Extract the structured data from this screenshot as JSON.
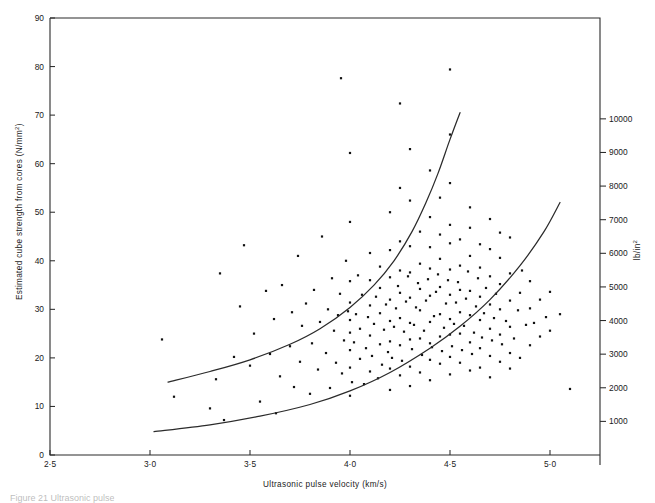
{
  "figure": {
    "caption": "Figure 21   Ultrasonic pulse",
    "background": "#ffffff",
    "ink_color": "#1a1a1a"
  },
  "chart_data": {
    "type": "scatter",
    "title": "",
    "xlabel": "Ultrasonic pulse velocity (km/s)",
    "ylabel": "Estimated cube strength from cores (N/mm²)",
    "y2label": "lb/in²",
    "xlim": [
      2.5,
      5.25
    ],
    "ylim": [
      0,
      90
    ],
    "y2lim": [
      0,
      13000
    ],
    "grid": false,
    "legend": null,
    "xticks": [
      "2·5",
      "3·0",
      "3·5",
      "4·0",
      "4·5",
      "5·0"
    ],
    "xtickvalues": [
      2.5,
      3.0,
      3.5,
      4.0,
      4.5,
      5.0
    ],
    "yticks": [
      "0",
      "10",
      "20",
      "30",
      "40",
      "50",
      "60",
      "70",
      "80",
      "90"
    ],
    "ytickvalues": [
      0,
      10,
      20,
      30,
      40,
      50,
      60,
      70,
      80,
      90
    ],
    "y2ticks": [
      "1000",
      "2000",
      "3000",
      "4000",
      "5000",
      "6000",
      "7000",
      "8000",
      "9000",
      "10000"
    ],
    "y2tickvalues": [
      1000,
      2000,
      3000,
      4000,
      5000,
      6000,
      7000,
      8000,
      9000,
      10000
    ],
    "annotations": [
      {
        "name": "upper-envelope-curve",
        "description": "upper bound curve",
        "points": [
          [
            3.09,
            15.0
          ],
          [
            3.3,
            17.2
          ],
          [
            3.5,
            19.6
          ],
          [
            3.7,
            22.8
          ],
          [
            3.85,
            26.0
          ],
          [
            4.0,
            30.4
          ],
          [
            4.12,
            35.0
          ],
          [
            4.22,
            40.0
          ],
          [
            4.31,
            46.0
          ],
          [
            4.38,
            52.0
          ],
          [
            4.44,
            58.0
          ],
          [
            4.5,
            65.0
          ],
          [
            4.55,
            70.5
          ]
        ]
      },
      {
        "name": "lower-envelope-curve",
        "description": "lower bound curve",
        "points": [
          [
            3.02,
            4.8
          ],
          [
            3.3,
            6.2
          ],
          [
            3.55,
            8.0
          ],
          [
            3.8,
            10.4
          ],
          [
            4.0,
            13.2
          ],
          [
            4.2,
            17.0
          ],
          [
            4.4,
            22.0
          ],
          [
            4.55,
            26.5
          ],
          [
            4.7,
            32.0
          ],
          [
            4.85,
            39.0
          ],
          [
            4.97,
            46.0
          ],
          [
            5.05,
            52.0
          ]
        ]
      }
    ],
    "series": [
      {
        "name": "core strength vs pulse velocity",
        "marker": "square-dot",
        "color": "#111111",
        "points": [
          [
            3.06,
            23.8
          ],
          [
            3.12,
            12.0
          ],
          [
            3.3,
            9.6
          ],
          [
            3.33,
            15.6
          ],
          [
            3.35,
            37.4
          ],
          [
            3.37,
            7.2
          ],
          [
            3.42,
            20.2
          ],
          [
            3.45,
            30.6
          ],
          [
            3.47,
            43.2
          ],
          [
            3.5,
            18.4
          ],
          [
            3.52,
            25.0
          ],
          [
            3.55,
            11.0
          ],
          [
            3.58,
            33.8
          ],
          [
            3.6,
            20.8
          ],
          [
            3.62,
            28.0
          ],
          [
            3.63,
            8.6
          ],
          [
            3.65,
            16.2
          ],
          [
            3.66,
            35.0
          ],
          [
            3.7,
            22.4
          ],
          [
            3.71,
            29.4
          ],
          [
            3.72,
            14.0
          ],
          [
            3.74,
            41.0
          ],
          [
            3.75,
            19.2
          ],
          [
            3.76,
            26.6
          ],
          [
            3.78,
            31.2
          ],
          [
            3.8,
            12.6
          ],
          [
            3.81,
            23.0
          ],
          [
            3.82,
            34.0
          ],
          [
            3.84,
            17.6
          ],
          [
            3.85,
            27.4
          ],
          [
            3.86,
            45.0
          ],
          [
            3.88,
            21.0
          ],
          [
            3.89,
            30.0
          ],
          [
            3.9,
            13.8
          ],
          [
            3.91,
            36.4
          ],
          [
            3.92,
            25.6
          ],
          [
            3.93,
            19.0
          ],
          [
            3.94,
            28.8
          ],
          [
            3.95,
            33.2
          ],
          [
            3.955,
            77.6
          ],
          [
            3.96,
            16.8
          ],
          [
            3.97,
            23.6
          ],
          [
            3.98,
            40.0
          ],
          [
            3.99,
            29.6
          ],
          [
            4.0,
            12.2
          ],
          [
            4.0,
            18.0
          ],
          [
            4.0,
            21.6
          ],
          [
            4.0,
            25.2
          ],
          [
            4.0,
            27.8
          ],
          [
            4.0,
            31.4
          ],
          [
            4.0,
            35.8
          ],
          [
            4.0,
            48.0
          ],
          [
            4.0,
            62.2
          ],
          [
            4.01,
            15.0
          ],
          [
            4.02,
            23.2
          ],
          [
            4.03,
            29.0
          ],
          [
            4.04,
            37.0
          ],
          [
            4.05,
            19.8
          ],
          [
            4.05,
            26.0
          ],
          [
            4.06,
            33.0
          ],
          [
            4.07,
            14.6
          ],
          [
            4.08,
            22.0
          ],
          [
            4.09,
            28.4
          ],
          [
            4.1,
            17.2
          ],
          [
            4.1,
            24.6
          ],
          [
            4.1,
            30.8
          ],
          [
            4.1,
            36.0
          ],
          [
            4.1,
            41.6
          ],
          [
            4.11,
            20.4
          ],
          [
            4.12,
            27.0
          ],
          [
            4.13,
            32.6
          ],
          [
            4.14,
            15.8
          ],
          [
            4.15,
            22.8
          ],
          [
            4.15,
            29.2
          ],
          [
            4.15,
            34.4
          ],
          [
            4.15,
            38.8
          ],
          [
            4.16,
            18.6
          ],
          [
            4.17,
            25.8
          ],
          [
            4.18,
            31.0
          ],
          [
            4.19,
            21.2
          ],
          [
            4.2,
            13.4
          ],
          [
            4.2,
            17.8
          ],
          [
            4.2,
            23.4
          ],
          [
            4.2,
            27.6
          ],
          [
            4.2,
            32.0
          ],
          [
            4.2,
            36.6
          ],
          [
            4.2,
            42.2
          ],
          [
            4.2,
            50.0
          ],
          [
            4.21,
            20.0
          ],
          [
            4.22,
            26.4
          ],
          [
            4.23,
            30.2
          ],
          [
            4.24,
            34.8
          ],
          [
            4.25,
            16.4
          ],
          [
            4.25,
            22.6
          ],
          [
            4.25,
            28.2
          ],
          [
            4.25,
            33.4
          ],
          [
            4.25,
            38.0
          ],
          [
            4.25,
            44.0
          ],
          [
            4.25,
            55.0
          ],
          [
            4.25,
            72.4
          ],
          [
            4.26,
            19.4
          ],
          [
            4.27,
            25.4
          ],
          [
            4.28,
            31.6
          ],
          [
            4.29,
            36.8
          ],
          [
            4.3,
            14.2
          ],
          [
            4.3,
            18.2
          ],
          [
            4.3,
            23.8
          ],
          [
            4.3,
            27.2
          ],
          [
            4.3,
            32.4
          ],
          [
            4.3,
            37.6
          ],
          [
            4.3,
            43.0
          ],
          [
            4.3,
            52.4
          ],
          [
            4.3,
            63.0
          ],
          [
            4.31,
            21.8
          ],
          [
            4.32,
            26.8
          ],
          [
            4.33,
            30.4
          ],
          [
            4.34,
            35.4
          ],
          [
            4.35,
            17.0
          ],
          [
            4.35,
            24.0
          ],
          [
            4.35,
            29.8
          ],
          [
            4.35,
            34.2
          ],
          [
            4.35,
            39.4
          ],
          [
            4.35,
            46.0
          ],
          [
            4.36,
            20.6
          ],
          [
            4.37,
            25.6
          ],
          [
            4.38,
            31.8
          ],
          [
            4.39,
            36.2
          ],
          [
            4.4,
            15.4
          ],
          [
            4.4,
            19.6
          ],
          [
            4.4,
            23.0
          ],
          [
            4.4,
            27.4
          ],
          [
            4.4,
            32.8
          ],
          [
            4.4,
            38.4
          ],
          [
            4.4,
            42.8
          ],
          [
            4.4,
            49.0
          ],
          [
            4.4,
            58.6
          ],
          [
            4.41,
            22.2
          ],
          [
            4.42,
            28.6
          ],
          [
            4.43,
            33.6
          ],
          [
            4.44,
            37.2
          ],
          [
            4.45,
            18.8
          ],
          [
            4.45,
            24.4
          ],
          [
            4.45,
            29.0
          ],
          [
            4.45,
            34.6
          ],
          [
            4.45,
            40.4
          ],
          [
            4.45,
            45.4
          ],
          [
            4.45,
            53.0
          ],
          [
            4.46,
            21.4
          ],
          [
            4.47,
            26.2
          ],
          [
            4.48,
            31.2
          ],
          [
            4.49,
            36.0
          ],
          [
            4.5,
            16.6
          ],
          [
            4.5,
            20.2
          ],
          [
            4.5,
            24.8
          ],
          [
            4.5,
            28.0
          ],
          [
            4.5,
            33.0
          ],
          [
            4.5,
            38.2
          ],
          [
            4.5,
            43.6
          ],
          [
            4.5,
            47.4
          ],
          [
            4.5,
            56.0
          ],
          [
            4.5,
            66.0
          ],
          [
            4.5,
            79.4
          ],
          [
            4.51,
            22.4
          ],
          [
            4.52,
            27.0
          ],
          [
            4.53,
            31.4
          ],
          [
            4.54,
            35.6
          ],
          [
            4.55,
            19.0
          ],
          [
            4.55,
            25.0
          ],
          [
            4.55,
            29.4
          ],
          [
            4.55,
            34.0
          ],
          [
            4.55,
            39.0
          ],
          [
            4.55,
            44.4
          ],
          [
            4.56,
            21.6
          ],
          [
            4.57,
            26.6
          ],
          [
            4.58,
            32.2
          ],
          [
            4.59,
            37.8
          ],
          [
            4.6,
            17.4
          ],
          [
            4.6,
            23.2
          ],
          [
            4.6,
            28.8
          ],
          [
            4.6,
            33.8
          ],
          [
            4.6,
            41.0
          ],
          [
            4.6,
            46.8
          ],
          [
            4.6,
            51.0
          ],
          [
            4.61,
            20.8
          ],
          [
            4.62,
            25.2
          ],
          [
            4.63,
            30.6
          ],
          [
            4.64,
            36.4
          ],
          [
            4.65,
            18.0
          ],
          [
            4.65,
            22.0
          ],
          [
            4.65,
            27.8
          ],
          [
            4.65,
            32.6
          ],
          [
            4.65,
            38.6
          ],
          [
            4.65,
            43.4
          ],
          [
            4.66,
            24.2
          ],
          [
            4.67,
            29.2
          ],
          [
            4.68,
            34.4
          ],
          [
            4.7,
            16.0
          ],
          [
            4.7,
            20.4
          ],
          [
            4.7,
            26.0
          ],
          [
            4.7,
            31.0
          ],
          [
            4.7,
            36.8
          ],
          [
            4.7,
            42.4
          ],
          [
            4.7,
            48.6
          ],
          [
            4.71,
            23.6
          ],
          [
            4.72,
            28.2
          ],
          [
            4.73,
            33.2
          ],
          [
            4.75,
            19.2
          ],
          [
            4.75,
            24.8
          ],
          [
            4.75,
            30.0
          ],
          [
            4.75,
            35.2
          ],
          [
            4.75,
            40.6
          ],
          [
            4.75,
            45.8
          ],
          [
            4.76,
            22.8
          ],
          [
            4.78,
            27.6
          ],
          [
            4.8,
            17.8
          ],
          [
            4.8,
            21.0
          ],
          [
            4.8,
            26.4
          ],
          [
            4.8,
            31.8
          ],
          [
            4.8,
            37.4
          ],
          [
            4.8,
            44.8
          ],
          [
            4.82,
            24.0
          ],
          [
            4.84,
            29.8
          ],
          [
            4.85,
            20.0
          ],
          [
            4.85,
            33.4
          ],
          [
            4.86,
            38.0
          ],
          [
            4.88,
            26.8
          ],
          [
            4.9,
            22.6
          ],
          [
            4.9,
            30.2
          ],
          [
            4.9,
            35.8
          ],
          [
            4.92,
            27.2
          ],
          [
            4.95,
            24.4
          ],
          [
            4.95,
            32.0
          ],
          [
            4.98,
            28.4
          ],
          [
            5.0,
            25.6
          ],
          [
            5.0,
            33.6
          ],
          [
            5.05,
            29.0
          ],
          [
            5.1,
            13.6
          ]
        ]
      }
    ]
  }
}
